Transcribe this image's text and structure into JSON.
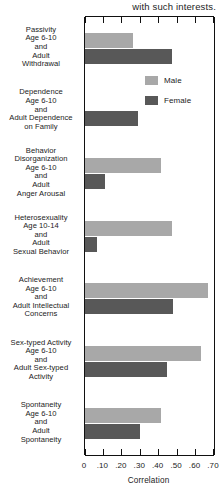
{
  "caption": "with such interests.",
  "legend": {
    "position": "inside-top-right",
    "entries": [
      {
        "label": "Male",
        "color": "#a8a8a8"
      },
      {
        "label": "Female",
        "color": "#585858"
      }
    ]
  },
  "chart_data": {
    "type": "bar",
    "orientation": "horizontal",
    "title": "",
    "subtitle": "",
    "xlabel": "Correlation",
    "ylabel": "",
    "xlim": [
      0,
      0.7
    ],
    "xticks": [
      0,
      0.1,
      0.2,
      0.3,
      0.4,
      0.5,
      0.6,
      0.7
    ],
    "xtick_labels": [
      "0",
      ".10",
      ".20",
      ".30",
      ".40",
      ".50",
      ".60",
      ".70"
    ],
    "grid": false,
    "categories": [
      [
        "Passivity",
        "Age 6-10",
        "and",
        "Adult",
        "Withdrawal"
      ],
      [
        "Dependence",
        "Age 6-10",
        "and",
        "Adult Dependence",
        "on Family"
      ],
      [
        "Behavior",
        "Disorganization",
        "Age 6-10",
        "and",
        "Adult",
        "Anger Arousal"
      ],
      [
        "Heterosexuality",
        "Age 10-14",
        "and",
        "Adult",
        "Sexual Behavior"
      ],
      [
        "Achievement",
        "Age 6-10",
        "and",
        "Adult Intellectual",
        "Concerns"
      ],
      [
        "Sex-typed Activity",
        "Age 6-10",
        "and",
        "Adult Sex-typed",
        "Activity"
      ],
      [
        "Spontaneity",
        "Age 6-10",
        "and",
        "Adult",
        "Spontaneity"
      ]
    ],
    "series": [
      {
        "name": "Male",
        "color": "#a8a8a8",
        "values": [
          0.26,
          0.0,
          0.41,
          0.47,
          0.67,
          0.63,
          0.41
        ]
      },
      {
        "name": "Female",
        "color": "#585858",
        "values": [
          0.47,
          0.29,
          0.11,
          0.065,
          0.475,
          0.445,
          0.3
        ]
      }
    ]
  }
}
